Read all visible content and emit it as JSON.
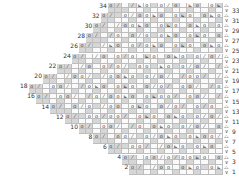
{
  "chart": {
    "title": "",
    "type": "knitting-chart",
    "rows": 34,
    "even_row_labels_left": [
      "34",
      "32",
      "30",
      "28",
      "26",
      "24",
      "22",
      "20",
      "18",
      "16",
      "14",
      "12",
      "10",
      "8",
      "6",
      "4",
      "2"
    ],
    "odd_row_labels_right": [
      "33",
      "31",
      "29",
      "27",
      "25",
      "23",
      "21",
      "19",
      "17",
      "15",
      "13",
      "11",
      "9",
      "7",
      "5",
      "3",
      "1"
    ],
    "symbols": {
      "o": "yarn-over",
      "/": "k2tog",
      "b": "sk2p",
      "v": "slip",
      "a": "edge"
    },
    "glyphs": {
      "o": "o",
      "/": "⁄",
      "b": "⊾",
      "v": "∨",
      "a": "⧍"
    },
    "colors": {
      "gray": "#d6d6d6",
      "white": "#fafafa",
      "grid": "#bdbdbd",
      "text": "#333333"
    },
    "row_patterns": [
      "o/ /bo o/o bo obo o/",
      "o/ o/oobo obo obo o/",
      "o/ /oobo obo obo o/o/",
      "o/ /o o/o obo obo o/",
      "o/ /bo o/obo obo obo",
      "o/ /o o/o bo obo o/",
      "o/ /o o/o/ oo bo o/",
      "o/ /oo/ /oobo o/",
      "o/ oo/ /obo obo o/",
      "o/ oo/ /o/oobo obo",
      "o/ o/o /oo obo o/",
      "o/ oo/oo/ obo obo o/",
      "o/ oo/ /o obo o/",
      "o/ oo/ o/obo obo",
      "o/ oo/ /obo obo o/",
      "o/ oo/o/oobo obo",
      "o/ /oo obo obo o/"
    ]
  }
}
